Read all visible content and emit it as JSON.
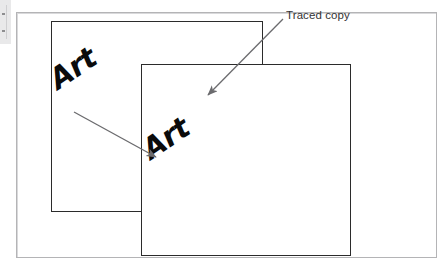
{
  "figure": {
    "type": "diagram",
    "background_color": "#ffffff",
    "frame_border_color": "#b4b4b6",
    "rectangle_border_color": "#2b2b2b",
    "arrow_color": "#6b6b6e",
    "text_color": "#0b0b0b",
    "label_color": "#333335"
  },
  "labels": {
    "traced_copy": "Traced copy"
  },
  "artwork": {
    "original_word": "Art",
    "traced_word": "Art",
    "rotation_degrees": -34
  },
  "shapes": {
    "page_frame": {
      "x": 16,
      "y": 12,
      "width": 421,
      "height": 246
    },
    "rectangle_original": {
      "x": 51,
      "y": 21,
      "width": 212,
      "height": 191
    },
    "rectangle_traced": {
      "x": 141,
      "y": 64,
      "width": 210,
      "height": 192
    }
  },
  "arrows": [
    {
      "name": "original-to-traced",
      "from_x": 74,
      "from_y": 112,
      "to_x": 158,
      "to_y": 158
    },
    {
      "name": "label-to-traced-copy",
      "from_x": 283,
      "from_y": 19,
      "to_x": 206,
      "to_y": 97
    }
  ]
}
